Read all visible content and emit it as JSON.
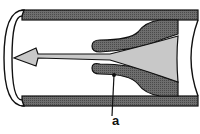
{
  "diagram": {
    "labels": [
      {
        "id": "a",
        "text": "a",
        "points_to": "valve cusp"
      }
    ],
    "colors": {
      "wall": "#6e6e6e",
      "flow": "#c8c8c8",
      "outline": "#111111",
      "background": "#ffffff"
    },
    "arrow_direction": "left"
  }
}
